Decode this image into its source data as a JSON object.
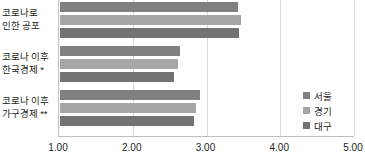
{
  "chart_data": {
    "type": "bar",
    "orientation": "horizontal",
    "title": "",
    "xlabel": "",
    "ylabel": "",
    "xlim": [
      1.0,
      5.0
    ],
    "xticks": [
      "1.00",
      "2.00",
      "3.00",
      "4.00",
      "5.00"
    ],
    "xtick_values": [
      1.0,
      2.0,
      3.0,
      4.0,
      5.0
    ],
    "grid": true,
    "legend_position": "right",
    "categories": [
      {
        "line1": "코로나로",
        "line2": "인한 공포"
      },
      {
        "line1": "코로나 이후",
        "line2": "한국경제 *"
      },
      {
        "line1": "코로나 이후",
        "line2": "가구경제 **"
      }
    ],
    "series": [
      {
        "name": "서울",
        "color": "#808080",
        "values": [
          3.42,
          2.63,
          2.9
        ]
      },
      {
        "name": "경기",
        "color": "#a6a6a6",
        "values": [
          3.45,
          2.6,
          2.85
        ]
      },
      {
        "name": "대구",
        "color": "#737373",
        "values": [
          3.43,
          2.55,
          2.82
        ]
      }
    ]
  },
  "legend": {
    "items": [
      {
        "label": "서울",
        "swatch": "legend-swatch-seoul"
      },
      {
        "label": "경기",
        "swatch": "legend-swatch-gyeonggi"
      },
      {
        "label": "대구",
        "swatch": "legend-swatch-daegu"
      }
    ]
  }
}
